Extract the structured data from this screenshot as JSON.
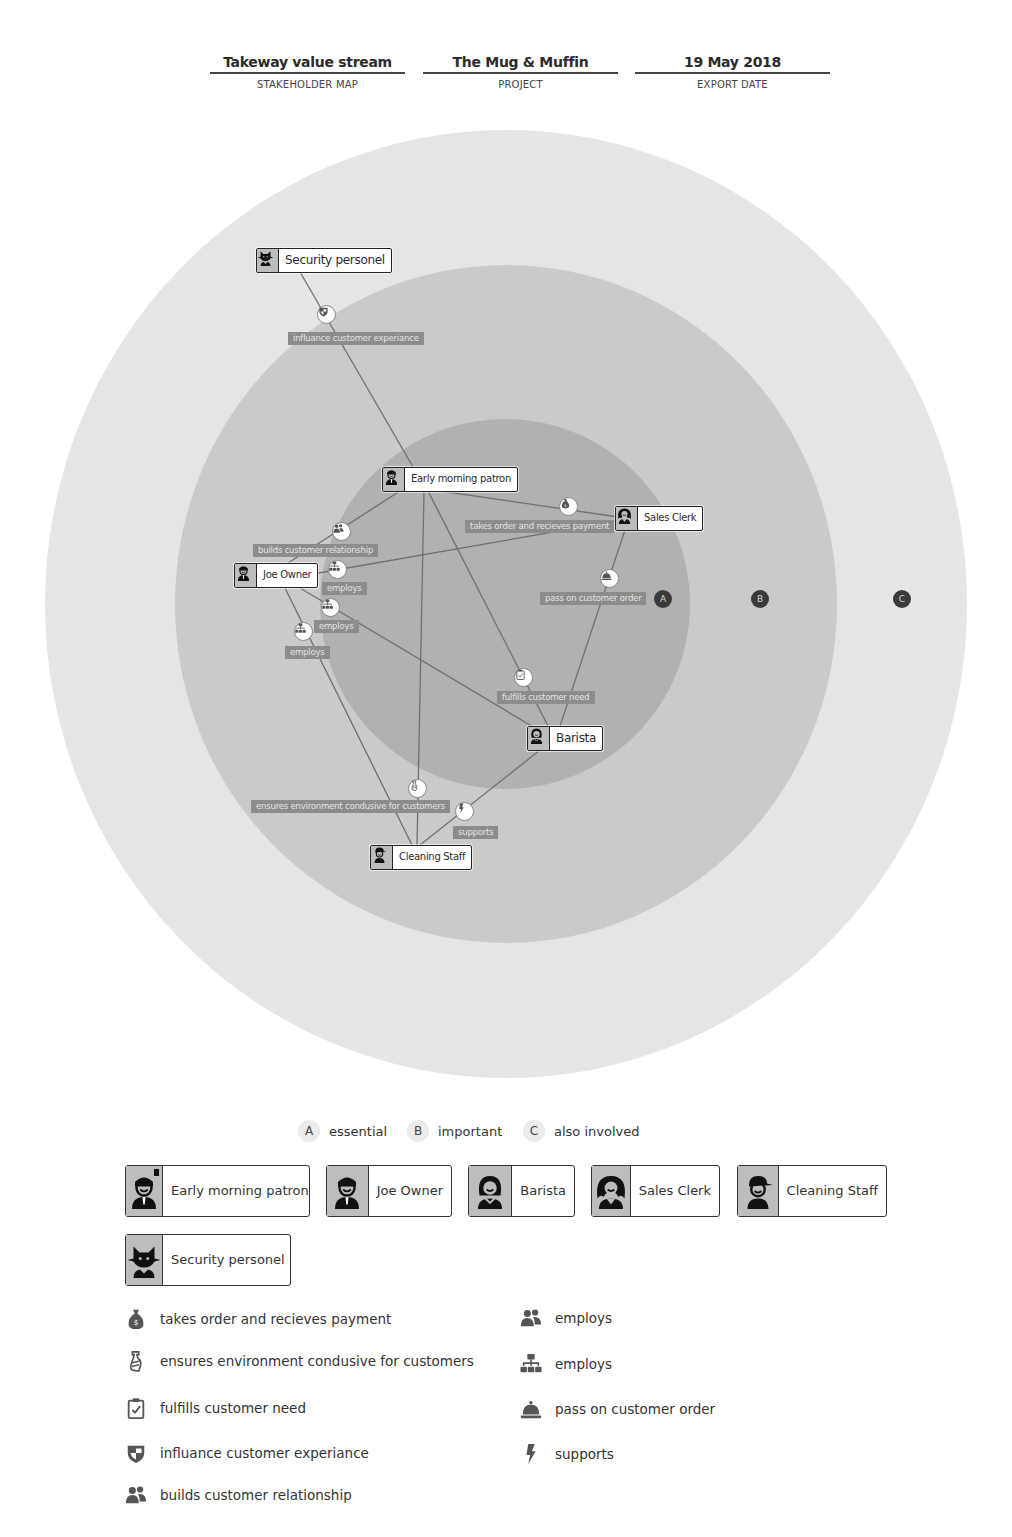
{
  "header": {
    "map_name": "Takeway value stream",
    "map_name_label": "STAKEHOLDER MAP",
    "project": "The Mug & Muffin",
    "project_label": "PROJECT",
    "export_date": "19 May 2018",
    "export_date_label": "EXPORT DATE"
  },
  "colors": {
    "ring_c": "#e5e5e5",
    "ring_b": "#cacaca",
    "ring_a": "#b1b1b1",
    "edge_line": "#6f6f6f",
    "edge_label_bg": "#8c8c8c",
    "badge": "#3a3a3a"
  },
  "rings": {
    "a": "A",
    "b": "B",
    "c": "C"
  },
  "stakeholders": {
    "security": "Security personel",
    "patron": "Early morning patron",
    "sales_clerk": "Sales Clerk",
    "joe": "Joe Owner",
    "barista": "Barista",
    "cleaning": "Cleaning Staff"
  },
  "relationships": {
    "influance": "influance customer experiance",
    "takes_order": "takes order and recieves payment",
    "builds": "builds customer relationship",
    "employs_1": "employs",
    "employs_2": "employs",
    "employs_3": "employs",
    "pass_on": "pass on customer order",
    "fulfills": "fulfills customer need",
    "ensures": "ensures environment condusive for customers",
    "supports": "supports"
  },
  "legend": {
    "levels": [
      {
        "badge": "A",
        "label": "essential"
      },
      {
        "badge": "B",
        "label": "important"
      },
      {
        "badge": "C",
        "label": "also involved"
      }
    ],
    "stakeholders": [
      {
        "label": "Early morning patron",
        "icon": "man-icon"
      },
      {
        "label": "Joe Owner",
        "icon": "man-icon"
      },
      {
        "label": "Barista",
        "icon": "woman-icon"
      },
      {
        "label": "Sales Clerk",
        "icon": "curly-woman-icon"
      },
      {
        "label": "Cleaning Staff",
        "icon": "cap-man-icon"
      },
      {
        "label": "Security personel",
        "icon": "cat-icon"
      }
    ],
    "relationships_left": [
      {
        "label": "takes order and recieves payment",
        "icon": "money-bag-icon"
      },
      {
        "label": "ensures environment condusive for customers",
        "icon": "spray-bottle-icon"
      },
      {
        "label": "fulfills customer need",
        "icon": "clipboard-check-icon"
      },
      {
        "label": "influance customer experiance",
        "icon": "shield-icon"
      },
      {
        "label": "builds customer relationship",
        "icon": "people-icon"
      }
    ],
    "relationships_right": [
      {
        "label": "employs",
        "icon": "people-icon"
      },
      {
        "label": "employs",
        "icon": "org-chart-icon"
      },
      {
        "label": "pass on customer order",
        "icon": "service-bell-icon"
      },
      {
        "label": "supports",
        "icon": "lightning-icon"
      }
    ]
  }
}
